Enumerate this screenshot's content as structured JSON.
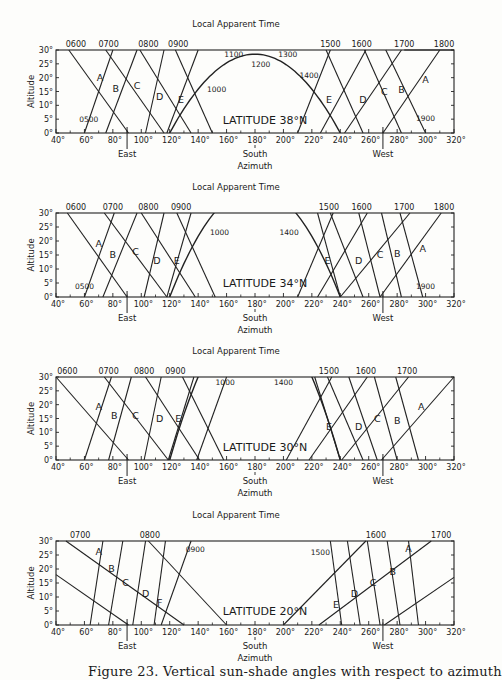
{
  "caption": "Figure 23.   Vertical sun-shade angles with respect to azimuth",
  "chart_data": [
    {
      "type": "line",
      "title": "LATITUDE 38°N",
      "top_label": "Local Apparent Time",
      "xlabel": "Azimuth",
      "ylabel": "Altitude",
      "xlim": [
        40,
        320
      ],
      "ylim": [
        0,
        30
      ],
      "x_ticks": [
        "40°",
        "60°",
        "80°",
        "100°",
        "120°",
        "140°",
        "160°",
        "180°",
        "200°",
        "220°",
        "240°",
        "260°",
        "280°",
        "300°",
        "320°"
      ],
      "y_ticks": [
        "0°",
        "5°",
        "10°",
        "15°",
        "20°",
        "25°",
        "30°"
      ],
      "direction_markers": [
        {
          "label": "East",
          "azimuth": 90
        },
        {
          "label": "South",
          "azimuth": 180
        },
        {
          "label": "West",
          "azimuth": 270
        }
      ],
      "time_labels": [
        "0500",
        "0600",
        "0700",
        "0800",
        "0900",
        "1000",
        "1100",
        "1200",
        "1300",
        "1400",
        "1500",
        "1600",
        "1700",
        "1800",
        "1900"
      ],
      "shade_labels": [
        "A",
        "B",
        "C",
        "D",
        "E",
        "E",
        "D",
        "C",
        "B",
        "A"
      ],
      "sun_path": [
        [
          60,
          0
        ],
        [
          70,
          9
        ],
        [
          82,
          18
        ],
        [
          95,
          26
        ],
        [
          108,
          30
        ]
      ],
      "sun_path_noon_arc": [
        [
          122,
          0
        ],
        [
          140,
          15
        ],
        [
          160,
          25
        ],
        [
          180,
          28
        ],
        [
          200,
          25
        ],
        [
          220,
          15
        ],
        [
          238,
          0
        ]
      ],
      "east_rising_lines": [
        [
          [
            60,
            0
          ],
          [
            80,
            30
          ]
        ],
        [
          [
            75,
            0
          ],
          [
            95,
            30
          ]
        ],
        [
          [
            103,
            0
          ],
          [
            118,
            30
          ]
        ],
        [
          [
            118,
            0
          ],
          [
            140,
            30
          ]
        ]
      ],
      "east_falling_lines": [
        [
          [
            49,
            30
          ],
          [
            91,
            0
          ]
        ],
        [
          [
            75,
            30
          ],
          [
            116,
            0
          ]
        ],
        [
          [
            99,
            30
          ],
          [
            135,
            0
          ]
        ],
        [
          [
            124,
            30
          ],
          [
            150,
            0
          ]
        ]
      ],
      "west_rising_lines": [
        [
          [
            210,
            0
          ],
          [
            233,
            30
          ]
        ],
        [
          [
            227,
            0
          ],
          [
            258,
            30
          ]
        ],
        [
          [
            242,
            0
          ],
          [
            283,
            30
          ]
        ],
        [
          [
            270,
            0
          ],
          [
            310,
            30
          ]
        ]
      ],
      "west_falling_lines": [
        [
          [
            231,
            30
          ],
          [
            256,
            0
          ]
        ],
        [
          [
            258,
            30
          ],
          [
            280,
            0
          ]
        ],
        [
          [
            283,
            30
          ],
          [
            300,
            0
          ]
        ]
      ]
    },
    {
      "type": "line",
      "title": "LATITUDE 34°N",
      "top_label": "Local Apparent Time",
      "xlabel": "Azimuth",
      "ylabel": "Altitude",
      "xlim": [
        40,
        320
      ],
      "ylim": [
        0,
        30
      ],
      "x_ticks": [
        "40°",
        "60°",
        "80°",
        "100°",
        "120°",
        "140°",
        "160°",
        "180°",
        "200°",
        "220°",
        "240°",
        "260°",
        "280°",
        "300°",
        "320°"
      ],
      "y_ticks": [
        "0°",
        "5°",
        "10°",
        "15°",
        "20°",
        "25°",
        "30°"
      ],
      "direction_markers": [
        {
          "label": "East",
          "azimuth": 90
        },
        {
          "label": "South",
          "azimuth": 180
        },
        {
          "label": "West",
          "azimuth": 270
        }
      ],
      "time_labels": [
        "0500",
        "0600",
        "0700",
        "0800",
        "0900",
        "1000",
        "1400",
        "1500",
        "1600",
        "1700",
        "1800",
        "1900"
      ],
      "shade_labels": [
        "A",
        "B",
        "C",
        "D",
        "E",
        "E",
        "D",
        "C",
        "B",
        "A"
      ]
    },
    {
      "type": "line",
      "title": "LATITUDE 30°N",
      "top_label": "Local Apparent Time",
      "xlabel": "Azimuth",
      "ylabel": "Altitude",
      "xlim": [
        40,
        320
      ],
      "ylim": [
        0,
        30
      ],
      "x_ticks": [
        "40°",
        "60°",
        "80°",
        "100°",
        "120°",
        "140°",
        "160°",
        "180°",
        "200°",
        "220°",
        "240°",
        "260°",
        "280°",
        "300°",
        "320°"
      ],
      "y_ticks": [
        "0°",
        "5°",
        "10°",
        "15°",
        "20°",
        "25°",
        "30°"
      ],
      "direction_markers": [
        {
          "label": "East",
          "azimuth": 90
        },
        {
          "label": "South",
          "azimuth": 180
        },
        {
          "label": "West",
          "azimuth": 270
        }
      ],
      "time_labels": [
        "0600",
        "0700",
        "0800",
        "0900",
        "1000",
        "1400",
        "1500",
        "1600",
        "1700"
      ],
      "shade_labels": [
        "A",
        "B",
        "C",
        "D",
        "E",
        "E",
        "D",
        "C",
        "B",
        "A"
      ]
    },
    {
      "type": "line",
      "title": "LATITUDE 20°N",
      "top_label": "Local Apparent Time",
      "xlabel": "Azimuth",
      "ylabel": "Altitude",
      "xlim": [
        40,
        320
      ],
      "ylim": [
        0,
        30
      ],
      "x_ticks": [
        "40°",
        "60°",
        "80°",
        "100°",
        "120°",
        "140°",
        "160°",
        "180°",
        "200°",
        "220°",
        "240°",
        "260°",
        "280°",
        "300°",
        "320°"
      ],
      "y_ticks": [
        "0°",
        "5°",
        "10°",
        "15°",
        "20°",
        "25°",
        "30°"
      ],
      "direction_markers": [
        {
          "label": "East",
          "azimuth": 90
        },
        {
          "label": "South",
          "azimuth": 180
        },
        {
          "label": "West",
          "azimuth": 270
        }
      ],
      "time_labels": [
        "0700",
        "0800",
        "0900",
        "1500",
        "1600",
        "1700"
      ],
      "shade_labels": [
        "A",
        "B",
        "C",
        "D",
        "F",
        "E",
        "D",
        "C",
        "B",
        "A"
      ]
    }
  ],
  "labels": {
    "top": "Local Apparent Time",
    "xlabel": "Azimuth",
    "ylabel": "Altitude",
    "east": "East",
    "south": "South",
    "west": "West",
    "lat38": "LATITUDE 38°N",
    "lat34": "LATITUDE 34°N",
    "lat30": "LATITUDE 30°N",
    "lat20": "LATITUDE 20°N"
  }
}
